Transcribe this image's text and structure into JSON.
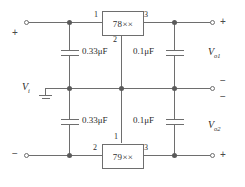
{
  "diagram": {
    "type": "schematic",
    "colors": {
      "wire": "#6e6e6e",
      "text": "#2b2b2b",
      "background": "#ffffff",
      "node": "#5a5a5a"
    }
  },
  "ics": [
    {
      "id": "positive-regulator",
      "label": "78××",
      "pin_left": "1",
      "pin_right": "3",
      "pin_bottom": "2"
    },
    {
      "id": "negative-regulator",
      "label": "79××",
      "pin_left": "2",
      "pin_right": "3",
      "pin_top": "1"
    }
  ],
  "capacitors": [
    {
      "id": "input-cap-top",
      "value": "0.33μF"
    },
    {
      "id": "input-cap-bottom",
      "value": "0.33μF"
    },
    {
      "id": "output-cap-top",
      "value": "0.1μF"
    },
    {
      "id": "output-cap-bottom",
      "value": "0.1μF"
    }
  ],
  "labels": {
    "input_voltage": "V",
    "input_voltage_sub": "i",
    "output1": "V",
    "output1_sub": "o1",
    "output2": "V",
    "output2_sub": "o2"
  },
  "polarity": {
    "left_top": "+",
    "left_bottom": "−",
    "right_top": "+",
    "right_mid_upper": "−",
    "right_mid_lower": "−",
    "right_bottom": "+"
  }
}
